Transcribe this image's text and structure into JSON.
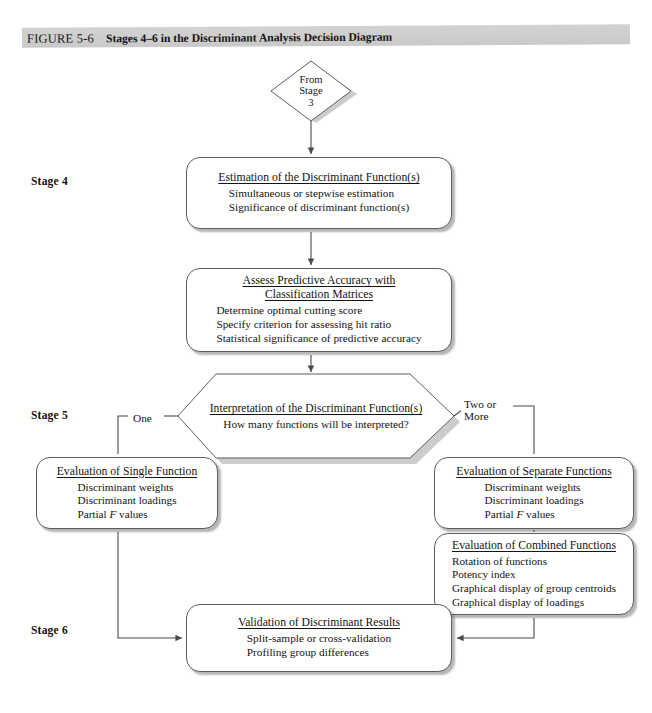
{
  "figure": {
    "label": "FIGURE 5-6",
    "title": "Stages 4–6 in the Discriminant Analysis Decision Diagram",
    "banner_color": "#cecece"
  },
  "stages": {
    "stage4": "Stage 4",
    "stage5": "Stage 5",
    "stage6": "Stage 6"
  },
  "nodes": {
    "from_stage_3": {
      "shape": "diamond",
      "line1": "From",
      "line2": "Stage",
      "line3": "3"
    },
    "estimation": {
      "shape": "rounded-rect",
      "title": "Estimation of the Discriminant Function(s)",
      "lines": [
        "Simultaneous or stepwise estimation",
        "Significance of discriminant function(s)"
      ]
    },
    "assess_accuracy": {
      "shape": "rounded-rect",
      "title_line1": "Assess Predictive Accuracy with",
      "title_line2": "Classification Matrices",
      "lines": [
        "Determine optimal cutting score",
        "Specify criterion for assessing hit ratio",
        "Statistical significance of predictive accuracy"
      ]
    },
    "interpretation": {
      "shape": "hexagon",
      "title": "Interpretation of the Discriminant Function(s)",
      "subtitle": "How many functions will be interpreted?"
    },
    "single_function": {
      "shape": "rounded-rect",
      "title": "Evaluation of Single Function",
      "lines": [
        "Discriminant weights",
        "Discriminant loadings"
      ],
      "line_italic_prefix": "Partial ",
      "line_italic": "F",
      "line_italic_suffix": " values"
    },
    "separate_functions": {
      "shape": "rounded-rect",
      "title": "Evaluation of Separate Functions",
      "lines": [
        "Discriminant weights",
        "Discriminant loadings"
      ],
      "line_italic_prefix": "Partial ",
      "line_italic": "F",
      "line_italic_suffix": " values"
    },
    "combined_functions": {
      "shape": "rounded-rect",
      "title": "Evaluation of Combined Functions",
      "lines": [
        "Rotation of functions",
        "Potency index",
        "Graphical display of group centroids",
        "Graphical display of loadings"
      ]
    },
    "validation": {
      "shape": "rounded-rect",
      "title": "Validation of Discriminant Results",
      "lines": [
        "Split-sample or cross-validation",
        "Profiling group differences"
      ]
    }
  },
  "branches": {
    "left": "One",
    "right_line1": "Two or",
    "right_line2": "More"
  },
  "colors": {
    "line": "#5d5d5d",
    "shadow": "rgba(90,90,90,0.45)",
    "text": "#141414",
    "page_background": "#ffffff"
  }
}
